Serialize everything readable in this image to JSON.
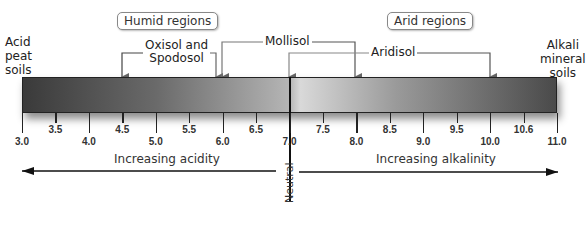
{
  "regions": {
    "humid": "Humid regions",
    "arid": "Arid regions"
  },
  "ends": {
    "left": [
      "Acid",
      "peat",
      "soils"
    ],
    "right": [
      "Alkali",
      "mineral",
      "soils"
    ]
  },
  "soils": {
    "oxisol": [
      "Oxisol and",
      "Spodosol"
    ],
    "mollisol": "Mollisol",
    "aridisol": "Aridisol"
  },
  "soil_ranges": [
    {
      "name": "Oxisol and Spodosol",
      "ph_min": 4.5,
      "ph_max": 5.9
    },
    {
      "name": "Mollisol",
      "ph_min": 6.0,
      "ph_max": 8.0
    },
    {
      "name": "Aridisol",
      "ph_min": 7.0,
      "ph_max": 10.0
    }
  ],
  "scale": {
    "min": 3.0,
    "max": 11.0,
    "major_labels": [
      "3.0",
      "4.0",
      "5.0",
      "6.0",
      "7.0",
      "8.0",
      "9.0",
      "10.0",
      "11.0"
    ],
    "minor_labels": [
      "3.5",
      "4.5",
      "5.5",
      "6.5",
      "7.5",
      "8.5",
      "9.5",
      "10.6"
    ]
  },
  "captions": {
    "acidity": "Increasing acidity",
    "alkalinity": "Increasing alkalinity",
    "neutral": "Neutral"
  }
}
